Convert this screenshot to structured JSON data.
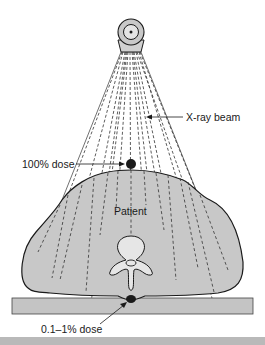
{
  "diagram": {
    "labels": {
      "beam": "X-ray beam",
      "entrance_dose": "100% dose",
      "patient": "Patient",
      "exit_dose": "0.1–1% dose"
    },
    "components": [
      "x-ray-tube",
      "x-ray-beam",
      "patient-cross-section",
      "vertebra",
      "table"
    ],
    "colors": {
      "patient_fill": "#c8c8c8",
      "table_fill": "#c4c4c4",
      "vertebra_fill": "#e6e6e6",
      "line": "#1a1a1a",
      "bottom_band": "#b9b9b9"
    }
  }
}
